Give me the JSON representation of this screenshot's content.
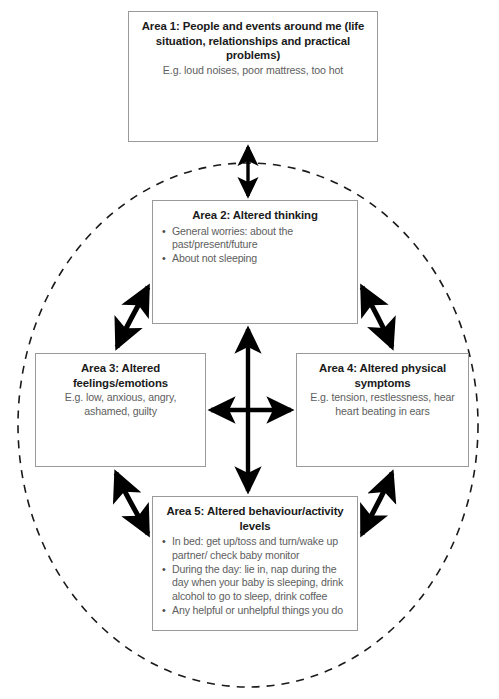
{
  "diagram": {
    "type": "cyclical-five-areas",
    "colors": {
      "box_border": "#9a9a9a",
      "heading_text": "#1a1a1a",
      "body_text": "#5e5e5e",
      "arrow": "#000000",
      "circle_dashed": "#1a1a1a",
      "background": "#ffffff"
    },
    "areas": [
      {
        "id": "area1",
        "title": "Area 1: People and events around me (life situation, relationships and practical problems)",
        "subtitle": "E.g. loud noises, poor mattress, too hot",
        "bullets": []
      },
      {
        "id": "area2",
        "title": "Area 2: Altered thinking",
        "subtitle": "",
        "bullets": [
          "General worries: about the past/present/future",
          "About not sleeping"
        ]
      },
      {
        "id": "area3",
        "title": "Area 3: Altered feelings/emotions",
        "subtitle": "E.g. low, anxious, angry, ashamed, guilty",
        "bullets": []
      },
      {
        "id": "area4",
        "title": "Area 4: Altered physical symptoms",
        "subtitle": "E.g. tension, restlessness, hear heart beating in ears",
        "bullets": []
      },
      {
        "id": "area5",
        "title": "Area 5: Altered behaviour/activity levels",
        "subtitle": "",
        "bullets": [
          "In bed: get up/toss and turn/wake up partner/ check baby monitor",
          "During the day: lie in, nap during the day when your baby is sleeping, drink alcohol to go to sleep, drink coffee",
          "Any helpful or unhelpful things you do"
        ]
      }
    ],
    "connectors": [
      {
        "name": "area1-to-area2",
        "from": "area1",
        "to": "area2",
        "style": "straight-vertical",
        "heads": "double"
      },
      {
        "name": "area2-to-area5",
        "from": "area2",
        "to": "area5",
        "style": "straight-vertical",
        "heads": "double"
      },
      {
        "name": "area3-to-area4",
        "from": "area3",
        "to": "area4",
        "style": "straight-horizontal",
        "heads": "double"
      },
      {
        "name": "area2-to-area3",
        "from": "area2",
        "to": "area3",
        "style": "curved-diagonal",
        "heads": "double"
      },
      {
        "name": "area2-to-area4",
        "from": "area2",
        "to": "area4",
        "style": "curved-diagonal",
        "heads": "double"
      },
      {
        "name": "area3-to-area5",
        "from": "area3",
        "to": "area5",
        "style": "curved-diagonal",
        "heads": "double"
      },
      {
        "name": "area4-to-area5",
        "from": "area4",
        "to": "area5",
        "style": "curved-diagonal",
        "heads": "double"
      }
    ],
    "enclosure": {
      "name": "dashed-cycle-circle",
      "shape": "ellipse",
      "line_style": "dashed",
      "encloses": [
        "area2",
        "area3",
        "area4",
        "area5"
      ]
    }
  }
}
